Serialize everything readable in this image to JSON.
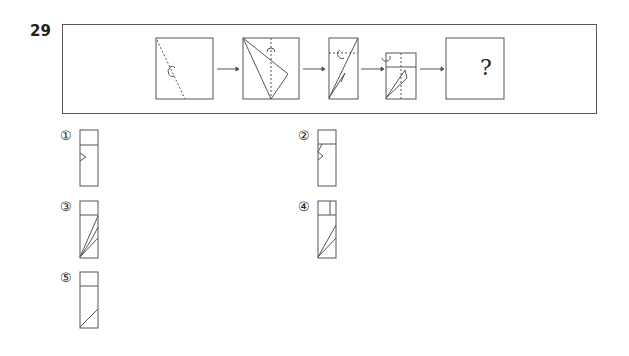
{
  "question": {
    "number": "29",
    "unknown_mark": "?",
    "steps": [
      "square-diagonal-fold",
      "folded-triangle",
      "folded-rectangle",
      "folded-small-rectangle",
      "unknown-result"
    ]
  },
  "options": [
    {
      "label": "①",
      "description": "tall rectangle with top band and small triangle notch on left"
    },
    {
      "label": "②",
      "description": "tall rectangle with top band and zigzag on left"
    },
    {
      "label": "③",
      "description": "tall rectangle with top band and three diagonal lines from bottom-left"
    },
    {
      "label": "④",
      "description": "tall rectangle with split top band and two diagonal lines"
    },
    {
      "label": "⑤",
      "description": "tall rectangle with top band and one diagonal line"
    }
  ],
  "colors": {
    "line": "#555555",
    "background": "#ffffff"
  }
}
